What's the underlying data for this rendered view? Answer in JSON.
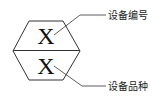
{
  "diagram": {
    "symbol_top": "X",
    "symbol_bottom": "X",
    "label_top": "设备编号",
    "label_bottom": "设备品种",
    "stroke_color": "#333333"
  }
}
